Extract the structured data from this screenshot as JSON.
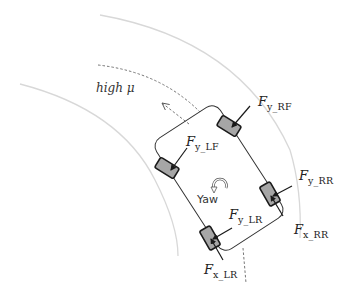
{
  "diagram": {
    "region_label": "high μ",
    "yaw_label": "Yaw",
    "yaw_icon": "curved-arrow-icon",
    "colors": {
      "road_edge": "#d8d8d8",
      "body_outline": "#333333",
      "wheel_fill": "#a6a6a6",
      "wheel_stroke": "#1a1a1a",
      "force_arrow": "#1a1a1a",
      "dashed_path": "#666666"
    },
    "forces": {
      "fy_rf": {
        "symbol": "F",
        "sub": "y_RF"
      },
      "fy_lf": {
        "symbol": "F",
        "sub": "y_LF"
      },
      "fy_rr": {
        "symbol": "F",
        "sub": "y_RR"
      },
      "fx_rr": {
        "symbol": "F",
        "sub": "x_RR"
      },
      "fy_lr": {
        "symbol": "F",
        "sub": "y_LR"
      },
      "fx_lr": {
        "symbol": "F",
        "sub": "x_LR"
      }
    },
    "wheels": [
      "RF",
      "LF",
      "RR",
      "LR"
    ]
  }
}
